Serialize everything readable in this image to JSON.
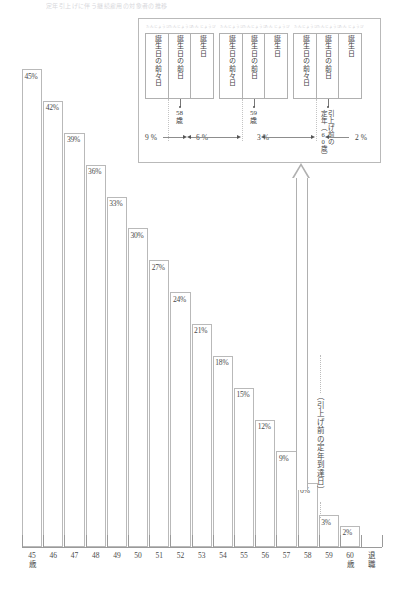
{
  "header": {
    "note": "定年引上げに伴う継続雇用の対象者の推移"
  },
  "chart_data": {
    "type": "bar",
    "title": "",
    "xlabel": "",
    "ylabel": "",
    "ylim": [
      0,
      45
    ],
    "grid": false,
    "legend": null,
    "categories": [
      "45歳",
      "46",
      "47",
      "48",
      "49",
      "50",
      "51",
      "52",
      "53",
      "54",
      "55",
      "56",
      "57",
      "58",
      "59",
      "60歳",
      "退職"
    ],
    "values": [
      45,
      42,
      39,
      36,
      33,
      30,
      27,
      24,
      21,
      18,
      15,
      12,
      9,
      6,
      3,
      2,
      null
    ],
    "value_labels": [
      "45%",
      "42%",
      "39%",
      "36%",
      "33%",
      "30%",
      "27%",
      "24%",
      "21%",
      "18%",
      "15%",
      "12%",
      "9%",
      "6%",
      "3%",
      "2%"
    ]
  },
  "axis": {
    "ticks": [
      {
        "label": "45",
        "unit": "歳"
      },
      {
        "label": "46",
        "unit": ""
      },
      {
        "label": "47",
        "unit": ""
      },
      {
        "label": "48",
        "unit": ""
      },
      {
        "label": "49",
        "unit": ""
      },
      {
        "label": "50",
        "unit": ""
      },
      {
        "label": "51",
        "unit": ""
      },
      {
        "label": "52",
        "unit": ""
      },
      {
        "label": "53",
        "unit": ""
      },
      {
        "label": "54",
        "unit": ""
      },
      {
        "label": "55",
        "unit": ""
      },
      {
        "label": "56",
        "unit": ""
      },
      {
        "label": "57",
        "unit": ""
      },
      {
        "label": "58",
        "unit": ""
      },
      {
        "label": "59",
        "unit": ""
      },
      {
        "label": "60",
        "unit": "歳"
      },
      {
        "label": "退",
        "unit": "職"
      }
    ]
  },
  "callout": {
    "vertical_caption": "（引上げ前の定年到達日）"
  },
  "detail": {
    "groups": [
      {
        "cells": [
          {
            "ruby": "たんじょうび",
            "text": "誕生日の前々日"
          },
          {
            "ruby": "たんじょうび",
            "text": "誕生日の前日"
          },
          {
            "ruby": "たんじょうび",
            "text": "誕生日"
          }
        ],
        "marker_label": "58歳",
        "marker_label_line1": "58",
        "marker_label_line2": "歳"
      },
      {
        "cells": [
          {
            "ruby": "たんじょうび",
            "text": "誕生日の前々日"
          },
          {
            "ruby": "たんじょうび",
            "text": "誕生日の前日"
          },
          {
            "ruby": "たんじょうび",
            "text": "誕生日"
          }
        ],
        "marker_label": "59歳",
        "marker_label_line1": "59",
        "marker_label_line2": "歳"
      },
      {
        "cells": [
          {
            "ruby": "たんじょうび",
            "text": "誕生日の前々日"
          },
          {
            "ruby": "たんじょうび",
            "text": "誕生日の前日"
          },
          {
            "ruby": "たんじょうび",
            "text": "誕生日"
          }
        ],
        "marker_label": "引上げ前の定年（60歳）",
        "marker_label_col_a": "引上げ前の",
        "marker_label_col_b": "定年（60歳）"
      }
    ],
    "percents": [
      "9 %",
      "6 %",
      "3 %",
      "2 %"
    ]
  }
}
